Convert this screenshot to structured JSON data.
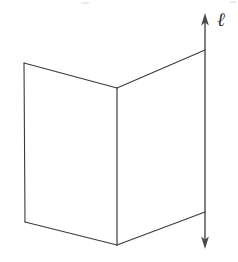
{
  "figure": {
    "background_color": "#ffffff",
    "width": 238,
    "height": 262,
    "stroke_color": "#3a3a3a",
    "face_color": "#ffffff",
    "stroke_width": 1.1
  },
  "labels": {
    "line_label": "ℓ",
    "line_label_color": "#2f2f2f",
    "line_label_x": 221,
    "line_label_y": 20
  },
  "line_l": {
    "name": "line-l",
    "x": 205,
    "y_top_tip": 14,
    "y_bottom_tip": 248,
    "arrow_top": "up-arrow",
    "arrow_bottom": "down-arrow",
    "color": "#4a4a4a",
    "width": 1.4
  },
  "planes": [
    {
      "name": "left-plane",
      "points": "24,63 117,88 117,245 25,222",
      "vertices": [
        {
          "label": "top-left",
          "x": 24,
          "y": 63
        },
        {
          "label": "top-apex",
          "x": 117,
          "y": 88
        },
        {
          "label": "bottom-apex",
          "x": 117,
          "y": 245
        },
        {
          "label": "bottom-left",
          "x": 25,
          "y": 222
        }
      ]
    },
    {
      "name": "right-plane",
      "points": "117,88 205,50 205,212 117,245",
      "vertices": [
        {
          "label": "top-apex",
          "x": 117,
          "y": 88
        },
        {
          "label": "top-right",
          "x": 205,
          "y": 50
        },
        {
          "label": "bottom-right",
          "x": 205,
          "y": 212
        },
        {
          "label": "bottom-apex",
          "x": 117,
          "y": 245
        }
      ]
    }
  ],
  "edges": {
    "fold_line": "M117,88 L117,245",
    "left_outer_edge": "M24,63 L25,222",
    "left_top_edge": "M24,63 L117,88",
    "left_bottom_edge": "M25,222 L117,245",
    "right_top_edge": "M117,88 L205,50",
    "right_bottom_edge": "M117,245 L205,212"
  }
}
